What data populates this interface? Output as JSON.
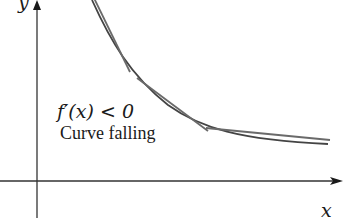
{
  "figure": {
    "derivative_label": "f′(x) < 0",
    "caption": "Curve falling",
    "x_axis_label": "x",
    "y_axis_label": "y",
    "colors": {
      "ink": "#1a1a1a",
      "curve": "#444444",
      "tangent": "#6a6a6a",
      "background": "#ffffff"
    },
    "tangent_count": 3
  }
}
